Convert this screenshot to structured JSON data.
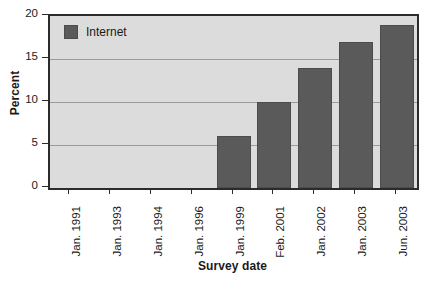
{
  "chart_data": {
    "type": "bar",
    "title": "",
    "subtitle": "",
    "xlabel": "Survey date",
    "ylabel": "Percent",
    "categories": [
      "Jan. 1991",
      "Jan. 1993",
      "Jan. 1994",
      "Jan. 1996",
      "Jan. 1999",
      "Feb. 2001",
      "Jan. 2002",
      "Jan. 2003",
      "Jun. 2003"
    ],
    "series": [
      {
        "name": "Internet",
        "values": [
          0,
          0,
          0,
          0,
          6,
          10,
          14,
          17,
          19
        ]
      }
    ],
    "ylim": [
      0,
      20
    ],
    "yticks": [
      0,
      5,
      10,
      15,
      20
    ],
    "ytick_labels": [
      "0",
      "5",
      "10",
      "15",
      "20"
    ],
    "gridlines": [
      5,
      10,
      15
    ],
    "grid": true,
    "legend": {
      "position": "top-left-inside",
      "entries": [
        {
          "label": "Internet",
          "color": "#5a5a5a"
        }
      ]
    },
    "colors": {
      "bar": "#5a5a5a",
      "bar_edge": "#4c4c4c",
      "plot_background": "#dcdcdc",
      "gridline": "#9a9a9a",
      "axis": "#2b2b2b",
      "text": "#1a1a1a",
      "page_background": "#ffffff"
    }
  }
}
